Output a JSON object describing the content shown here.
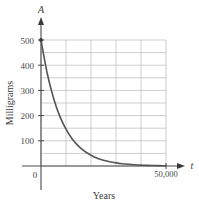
{
  "chart_data": {
    "type": "line",
    "title": "",
    "subtitle": "",
    "xlabel": "Years",
    "ylabel": "Milligrams",
    "x_axis_variable": "t",
    "y_axis_variable": "A",
    "xlim": [
      0,
      50000
    ],
    "ylim": [
      0,
      500
    ],
    "grid": true,
    "legend": null,
    "x_tick_labels": [
      "0",
      "50,000"
    ],
    "x_tick_values": [
      0,
      50000
    ],
    "y_tick_labels": [
      "0",
      "100",
      "200",
      "300",
      "400",
      "500"
    ],
    "y_tick_values": [
      0,
      100,
      200,
      300,
      400,
      500
    ],
    "x_gridline_values": [
      0,
      10000,
      20000,
      30000,
      40000,
      50000
    ],
    "y_gridline_values": [
      0,
      50,
      100,
      150,
      200,
      250,
      300,
      350,
      400,
      450,
      500
    ],
    "series": [
      {
        "name": "Amount remaining",
        "color": "#555555",
        "start_marker": true,
        "x": [
          0,
          2500,
          5000,
          7500,
          10000,
          12500,
          15000,
          17500,
          20000,
          22500,
          25000,
          27500,
          30000,
          32500,
          35000,
          37500,
          40000,
          42500,
          45000,
          47500,
          50000
        ],
        "values": [
          500,
          367,
          270,
          198,
          146,
          107,
          78.7,
          57.8,
          42.5,
          31.2,
          22.9,
          16.8,
          12.4,
          9.1,
          6.7,
          4.9,
          3.6,
          2.6,
          1.9,
          1.4,
          1.0
        ]
      }
    ]
  },
  "axis": {
    "y_variable": "A",
    "x_variable": "t",
    "x_name": "Years",
    "y_name": "Milligrams",
    "x_end_label": "50,000",
    "origin_label": "0"
  },
  "ticks": {
    "y": [
      "500",
      "400",
      "300",
      "200",
      "100"
    ]
  },
  "colors": {
    "curve": "#555555",
    "grid": "#b9b9b9",
    "axis": "#4a4a4a",
    "text": "#3b3b3b",
    "background": "#ffffff"
  }
}
